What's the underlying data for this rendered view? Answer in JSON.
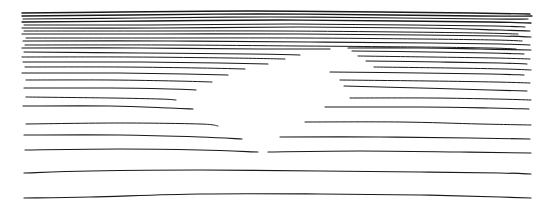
{
  "document": {
    "title": "Hand-drawn horizontal stroke sketch",
    "type": "line-sketch",
    "width": 552,
    "height": 211,
    "background_color": "#ffffff",
    "ink_color": "#1a1a1a",
    "description": "A freehand pen sketch consisting only of roughly horizontal strokes. Strokes are densely stacked at the top and spread progressively farther apart toward the bottom. A white wedge-shaped negative space in the centre splits many of the middle strokes into separate left and right segments."
  },
  "canvas": {
    "width": 552,
    "height": 211,
    "background_color": "#ffffff"
  },
  "ink": {
    "color": "#1a1a1a",
    "min_stroke_width": 0.7,
    "max_stroke_width": 1.5
  },
  "regions": [
    {
      "name": "dense-top-band",
      "y_range": [
        10,
        44
      ],
      "stroke_count": 11,
      "note": "Tightly packed near-parallel strokes spanning nearly the full width."
    },
    {
      "name": "split-middle-band",
      "y_range": [
        46,
        150
      ],
      "stroke_count": 18,
      "note": "Strokes split into left and right segments around a central white wedge."
    },
    {
      "name": "sparse-bottom-band",
      "y_range": [
        150,
        200
      ],
      "stroke_count": 4,
      "note": "Widely spaced full-width strokes."
    }
  ],
  "chart_data": {
    "type": "line",
    "subtitle": "",
    "xlabel": "",
    "ylabel": "",
    "xlim": [
      0,
      552
    ],
    "ylim": [
      0,
      211
    ],
    "grid": false,
    "legend": null,
    "annotations": [],
    "strokes": [
      {
        "id": "s01",
        "width": 1.4,
        "points": [
          [
            22,
            13
          ],
          [
            120,
            12
          ],
          [
            250,
            11
          ],
          [
            380,
            12
          ],
          [
            470,
            13
          ],
          [
            530,
            14
          ]
        ]
      },
      {
        "id": "s02",
        "width": 1.3,
        "points": [
          [
            22,
            16
          ],
          [
            130,
            15
          ],
          [
            260,
            14
          ],
          [
            390,
            15
          ],
          [
            480,
            16
          ],
          [
            532,
            16
          ]
        ]
      },
      {
        "id": "s03",
        "width": 1.2,
        "points": [
          [
            23,
            19
          ],
          [
            140,
            18
          ],
          [
            270,
            17
          ],
          [
            400,
            18
          ],
          [
            490,
            19
          ],
          [
            528,
            19
          ]
        ]
      },
      {
        "id": "s04",
        "width": 1.3,
        "points": [
          [
            22,
            22
          ],
          [
            150,
            21
          ],
          [
            280,
            20
          ],
          [
            400,
            21
          ],
          [
            490,
            22
          ],
          [
            531,
            23
          ]
        ]
      },
      {
        "id": "s05",
        "width": 1.1,
        "points": [
          [
            24,
            25
          ],
          [
            150,
            25
          ],
          [
            290,
            24
          ],
          [
            410,
            25
          ],
          [
            495,
            26
          ],
          [
            525,
            27
          ]
        ]
      },
      {
        "id": "s06",
        "width": 1.2,
        "points": [
          [
            22,
            28
          ],
          [
            160,
            28
          ],
          [
            300,
            27
          ],
          [
            420,
            28
          ],
          [
            500,
            30
          ],
          [
            530,
            31
          ]
        ]
      },
      {
        "id": "s07",
        "width": 1.0,
        "points": [
          [
            24,
            31
          ],
          [
            150,
            31
          ],
          [
            280,
            31
          ],
          [
            400,
            32
          ],
          [
            480,
            33
          ],
          [
            518,
            34
          ]
        ]
      },
      {
        "id": "s08",
        "width": 1.2,
        "points": [
          [
            22,
            34
          ],
          [
            160,
            34
          ],
          [
            300,
            34
          ],
          [
            420,
            35
          ],
          [
            500,
            36
          ],
          [
            531,
            37
          ]
        ]
      },
      {
        "id": "s09",
        "width": 1.0,
        "points": [
          [
            26,
            38
          ],
          [
            160,
            38
          ],
          [
            300,
            38
          ],
          [
            420,
            39
          ],
          [
            495,
            40
          ],
          [
            522,
            41
          ]
        ]
      },
      {
        "id": "s10",
        "width": 1.1,
        "points": [
          [
            23,
            41
          ],
          [
            170,
            41
          ],
          [
            310,
            42
          ],
          [
            430,
            43
          ],
          [
            500,
            44
          ],
          [
            530,
            45
          ]
        ]
      },
      {
        "id": "s11",
        "width": 1.0,
        "points": [
          [
            25,
            45
          ],
          [
            170,
            45
          ],
          [
            300,
            46
          ],
          [
            420,
            47
          ],
          [
            490,
            48
          ],
          [
            516,
            49
          ]
        ]
      },
      {
        "id": "s12L",
        "width": 1.2,
        "points": [
          [
            22,
            48
          ],
          [
            140,
            48
          ],
          [
            260,
            49
          ],
          [
            330,
            49
          ]
        ]
      },
      {
        "id": "s12R",
        "width": 1.2,
        "points": [
          [
            348,
            48
          ],
          [
            420,
            48
          ],
          [
            480,
            49
          ],
          [
            531,
            50
          ]
        ]
      },
      {
        "id": "s13L",
        "width": 1.1,
        "points": [
          [
            24,
            52
          ],
          [
            140,
            53
          ],
          [
            250,
            54
          ],
          [
            300,
            55
          ]
        ]
      },
      {
        "id": "s13R",
        "width": 1.1,
        "points": [
          [
            352,
            51
          ],
          [
            430,
            52
          ],
          [
            490,
            53
          ],
          [
            524,
            54
          ]
        ]
      },
      {
        "id": "s14L",
        "width": 1.0,
        "points": [
          [
            22,
            57
          ],
          [
            130,
            57
          ],
          [
            230,
            58
          ],
          [
            285,
            59
          ]
        ]
      },
      {
        "id": "s14R",
        "width": 1.0,
        "points": [
          [
            358,
            56
          ],
          [
            430,
            57
          ],
          [
            495,
            58
          ],
          [
            530,
            59
          ]
        ]
      },
      {
        "id": "s15L",
        "width": 1.1,
        "points": [
          [
            23,
            62
          ],
          [
            130,
            62
          ],
          [
            220,
            63
          ],
          [
            268,
            64
          ]
        ]
      },
      {
        "id": "s15R",
        "width": 1.1,
        "points": [
          [
            366,
            61
          ],
          [
            440,
            62
          ],
          [
            500,
            63
          ],
          [
            527,
            64
          ]
        ]
      },
      {
        "id": "s16L",
        "width": 1.0,
        "points": [
          [
            25,
            67
          ],
          [
            120,
            67
          ],
          [
            200,
            68
          ],
          [
            245,
            69
          ]
        ]
      },
      {
        "id": "s16R",
        "width": 1.0,
        "points": [
          [
            374,
            67
          ],
          [
            450,
            68
          ],
          [
            505,
            69
          ],
          [
            531,
            70
          ]
        ]
      },
      {
        "id": "s17L",
        "width": 1.1,
        "points": [
          [
            22,
            73
          ],
          [
            110,
            73
          ],
          [
            185,
            74
          ],
          [
            228,
            75
          ]
        ]
      },
      {
        "id": "s17R",
        "width": 1.1,
        "points": [
          [
            330,
            72
          ],
          [
            420,
            73
          ],
          [
            490,
            74
          ],
          [
            524,
            75
          ]
        ]
      },
      {
        "id": "s18L",
        "width": 1.0,
        "points": [
          [
            26,
            80
          ],
          [
            110,
            80
          ],
          [
            175,
            81
          ],
          [
            212,
            82
          ]
        ]
      },
      {
        "id": "s18R",
        "width": 1.0,
        "points": [
          [
            340,
            80
          ],
          [
            430,
            81
          ],
          [
            495,
            82
          ],
          [
            530,
            83
          ]
        ]
      },
      {
        "id": "s19L",
        "width": 1.1,
        "points": [
          [
            24,
            88
          ],
          [
            110,
            88
          ],
          [
            170,
            89
          ],
          [
            196,
            90
          ]
        ]
      },
      {
        "id": "s19R",
        "width": 1.1,
        "points": [
          [
            344,
            86
          ],
          [
            420,
            88
          ],
          [
            490,
            90
          ],
          [
            527,
            91
          ]
        ]
      },
      {
        "id": "s20L",
        "width": 1.0,
        "points": [
          [
            26,
            97
          ],
          [
            110,
            98
          ],
          [
            160,
            99
          ],
          [
            176,
            100
          ]
        ]
      },
      {
        "id": "s20R",
        "width": 1.0,
        "points": [
          [
            350,
            98
          ],
          [
            430,
            98
          ],
          [
            495,
            99
          ],
          [
            531,
            100
          ]
        ]
      },
      {
        "id": "s21L",
        "width": 1.1,
        "points": [
          [
            23,
            106
          ],
          [
            110,
            106
          ],
          [
            170,
            108
          ],
          [
            193,
            109
          ]
        ]
      },
      {
        "id": "s21R",
        "width": 1.1,
        "points": [
          [
            325,
            107
          ],
          [
            420,
            107
          ],
          [
            490,
            108
          ],
          [
            529,
            109
          ]
        ]
      },
      {
        "id": "s22L",
        "width": 1.0,
        "points": [
          [
            26,
            124
          ],
          [
            120,
            123
          ],
          [
            200,
            124
          ],
          [
            218,
            126
          ]
        ]
      },
      {
        "id": "s22R",
        "width": 1.0,
        "points": [
          [
            305,
            122
          ],
          [
            400,
            122
          ],
          [
            480,
            124
          ],
          [
            531,
            125
          ]
        ]
      },
      {
        "id": "s23L",
        "width": 1.1,
        "points": [
          [
            24,
            135
          ],
          [
            120,
            135
          ],
          [
            200,
            137
          ],
          [
            242,
            139
          ]
        ]
      },
      {
        "id": "s23R",
        "width": 1.1,
        "points": [
          [
            280,
            137
          ],
          [
            380,
            137
          ],
          [
            470,
            138
          ],
          [
            530,
            139
          ]
        ]
      },
      {
        "id": "s24L",
        "width": 1.1,
        "points": [
          [
            25,
            150
          ],
          [
            120,
            149
          ],
          [
            200,
            150
          ],
          [
            258,
            152
          ]
        ]
      },
      {
        "id": "s24R",
        "width": 1.1,
        "points": [
          [
            268,
            152
          ],
          [
            360,
            151
          ],
          [
            460,
            152
          ],
          [
            531,
            153
          ]
        ]
      },
      {
        "id": "s25",
        "width": 1.2,
        "points": [
          [
            24,
            173
          ],
          [
            90,
            171
          ],
          [
            200,
            170
          ],
          [
            320,
            171
          ],
          [
            420,
            172
          ],
          [
            500,
            173
          ],
          [
            531,
            174
          ]
        ]
      },
      {
        "id": "s26",
        "width": 1.2,
        "points": [
          [
            24,
            198
          ],
          [
            90,
            197
          ],
          [
            200,
            194
          ],
          [
            320,
            194
          ],
          [
            420,
            195
          ],
          [
            500,
            197
          ],
          [
            531,
            198
          ]
        ]
      }
    ]
  }
}
